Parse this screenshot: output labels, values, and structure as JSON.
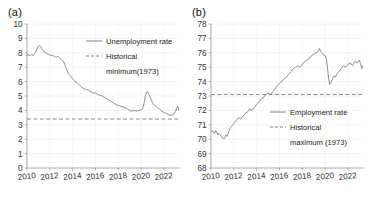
{
  "figure": {
    "panels": [
      {
        "label": "(a)",
        "name": "panel-a-unemployment"
      },
      {
        "label": "(b)",
        "name": "panel-b-employment"
      }
    ]
  },
  "chart_data": [
    {
      "type": "line",
      "panel": "(a)",
      "title": "",
      "xlabel": "",
      "ylabel": "",
      "xlim": [
        2010.0,
        2023.4
      ],
      "ylim": [
        0,
        10
      ],
      "grid": true,
      "legend_position": "upper-right-inside",
      "xticks": [
        "2010",
        "2012",
        "2014",
        "2016",
        "2018",
        "2020",
        "2022"
      ],
      "xtick_values": [
        2010,
        2012,
        2014,
        2016,
        2018,
        2020,
        2022
      ],
      "yticks": [
        "0",
        "1",
        "2",
        "3",
        "4",
        "5",
        "6",
        "7",
        "8",
        "9",
        "10"
      ],
      "ytick_values": [
        0,
        1,
        2,
        3,
        4,
        5,
        6,
        7,
        8,
        9,
        10
      ],
      "series": [
        {
          "name": "Unemployment rate",
          "style": "solid",
          "color": "#808080",
          "x": [
            2010.0,
            2010.1,
            2010.2,
            2010.3,
            2010.4,
            2010.5,
            2010.6,
            2010.7,
            2010.8,
            2010.9,
            2011.0,
            2011.1,
            2011.2,
            2011.3,
            2011.4,
            2011.5,
            2011.6,
            2011.7,
            2011.8,
            2011.9,
            2012.0,
            2012.1,
            2012.2,
            2012.3,
            2012.4,
            2012.5,
            2012.6,
            2012.7,
            2012.8,
            2012.9,
            2013.0,
            2013.1,
            2013.2,
            2013.3,
            2013.4,
            2013.5,
            2013.6,
            2013.7,
            2013.8,
            2013.9,
            2014.0,
            2014.2,
            2014.4,
            2014.6,
            2014.8,
            2015.0,
            2015.2,
            2015.4,
            2015.6,
            2015.8,
            2016.0,
            2016.2,
            2016.4,
            2016.6,
            2016.8,
            2017.0,
            2017.2,
            2017.4,
            2017.6,
            2017.8,
            2018.0,
            2018.2,
            2018.4,
            2018.6,
            2018.8,
            2019.0,
            2019.2,
            2019.4,
            2019.6,
            2019.8,
            2020.0,
            2020.1,
            2020.2,
            2020.3,
            2020.4,
            2020.5,
            2020.6,
            2020.7,
            2020.8,
            2020.9,
            2021.0,
            2021.2,
            2021.4,
            2021.6,
            2021.8,
            2022.0,
            2022.2,
            2022.4,
            2022.6,
            2022.8,
            2023.0,
            2023.1,
            2023.2,
            2023.3
          ],
          "y": [
            7.8,
            7.9,
            7.8,
            7.8,
            7.9,
            7.8,
            7.9,
            8.0,
            8.1,
            8.3,
            8.45,
            8.5,
            8.45,
            8.3,
            8.2,
            8.1,
            8.0,
            8.0,
            7.9,
            7.9,
            7.85,
            7.8,
            7.85,
            7.8,
            7.75,
            7.7,
            7.7,
            7.75,
            7.7,
            7.6,
            7.55,
            7.5,
            7.4,
            7.2,
            7.0,
            6.8,
            6.6,
            6.5,
            6.4,
            6.3,
            6.2,
            6.0,
            5.9,
            5.75,
            5.6,
            5.5,
            5.45,
            5.4,
            5.3,
            5.2,
            5.2,
            5.1,
            5.05,
            5.0,
            4.9,
            4.8,
            4.7,
            4.6,
            4.5,
            4.4,
            4.35,
            4.3,
            4.25,
            4.2,
            4.1,
            4.0,
            3.95,
            4.0,
            3.95,
            4.0,
            4.05,
            4.1,
            4.3,
            4.7,
            5.1,
            5.3,
            5.25,
            5.1,
            4.9,
            4.7,
            4.5,
            4.35,
            4.2,
            4.1,
            3.95,
            3.85,
            3.8,
            3.7,
            3.65,
            3.7,
            3.9,
            4.15,
            4.3,
            4.0
          ]
        }
      ],
      "reference_lines": [
        {
          "name": "Historical minimum(1973)",
          "style": "dashed",
          "color": "#808080",
          "value": 3.4
        }
      ],
      "legend": [
        {
          "label": "Unemployment rate",
          "style": "solid"
        },
        {
          "label": "Historical",
          "style": "dashed"
        },
        {
          "label": "minimum(1973)",
          "style": "none"
        }
      ]
    },
    {
      "type": "line",
      "panel": "(b)",
      "title": "",
      "xlabel": "",
      "ylabel": "",
      "xlim": [
        2010.0,
        2023.4
      ],
      "ylim": [
        68,
        78
      ],
      "grid": true,
      "legend_position": "lower-right-inside",
      "xticks": [
        "2010",
        "2012",
        "2014",
        "2016",
        "2018",
        "2020",
        "2022"
      ],
      "xtick_values": [
        2010,
        2012,
        2014,
        2016,
        2018,
        2020,
        2022
      ],
      "yticks": [
        "68",
        "69",
        "70",
        "71",
        "72",
        "73",
        "74",
        "75",
        "76",
        "77",
        "78"
      ],
      "ytick_values": [
        68,
        69,
        70,
        71,
        72,
        73,
        74,
        75,
        76,
        77,
        78
      ],
      "series": [
        {
          "name": "Employment rate",
          "style": "solid",
          "color": "#808080",
          "x": [
            2010.0,
            2010.1,
            2010.2,
            2010.3,
            2010.4,
            2010.5,
            2010.6,
            2010.7,
            2010.8,
            2010.9,
            2011.0,
            2011.1,
            2011.2,
            2011.3,
            2011.4,
            2011.5,
            2011.6,
            2011.7,
            2011.8,
            2011.9,
            2012.0,
            2012.2,
            2012.4,
            2012.6,
            2012.8,
            2013.0,
            2013.2,
            2013.4,
            2013.6,
            2013.8,
            2014.0,
            2014.2,
            2014.4,
            2014.6,
            2014.8,
            2015.0,
            2015.2,
            2015.4,
            2015.6,
            2015.8,
            2016.0,
            2016.2,
            2016.4,
            2016.6,
            2016.8,
            2017.0,
            2017.2,
            2017.4,
            2017.6,
            2017.8,
            2018.0,
            2018.2,
            2018.4,
            2018.6,
            2018.8,
            2019.0,
            2019.2,
            2019.4,
            2019.5,
            2019.6,
            2019.8,
            2020.0,
            2020.1,
            2020.2,
            2020.3,
            2020.4,
            2020.5,
            2020.6,
            2020.7,
            2020.8,
            2020.9,
            2021.0,
            2021.2,
            2021.4,
            2021.6,
            2021.8,
            2022.0,
            2022.2,
            2022.4,
            2022.6,
            2022.8,
            2023.0,
            2023.1,
            2023.2,
            2023.3
          ],
          "y": [
            70.5,
            70.6,
            70.5,
            70.4,
            70.6,
            70.5,
            70.3,
            70.4,
            70.3,
            70.2,
            70.1,
            70.0,
            70.1,
            70.3,
            70.2,
            70.4,
            70.6,
            70.8,
            70.9,
            71.0,
            71.1,
            71.3,
            71.5,
            71.4,
            71.6,
            71.8,
            71.9,
            72.1,
            72.0,
            72.2,
            72.4,
            72.6,
            72.8,
            72.9,
            73.1,
            73.2,
            73.1,
            73.3,
            73.5,
            73.7,
            73.9,
            74.0,
            74.2,
            74.3,
            74.5,
            74.7,
            74.9,
            75.0,
            75.1,
            75.0,
            75.2,
            75.4,
            75.5,
            75.6,
            75.8,
            75.9,
            76.0,
            76.1,
            76.3,
            76.1,
            75.9,
            75.8,
            75.6,
            75.0,
            74.2,
            73.8,
            73.9,
            74.1,
            74.3,
            74.4,
            74.3,
            74.5,
            74.7,
            74.9,
            75.1,
            75.0,
            75.2,
            75.3,
            75.1,
            75.4,
            75.3,
            75.5,
            75.2,
            74.9,
            75.1
          ]
        }
      ],
      "reference_lines": [
        {
          "name": "Historical maximum (1973)",
          "style": "dashed",
          "color": "#808080",
          "value": 73.1
        }
      ],
      "legend": [
        {
          "label": "Employment rate",
          "style": "solid"
        },
        {
          "label": "Historical",
          "style": "dashed"
        },
        {
          "label": "maximum (1973)",
          "style": "none"
        }
      ]
    }
  ]
}
